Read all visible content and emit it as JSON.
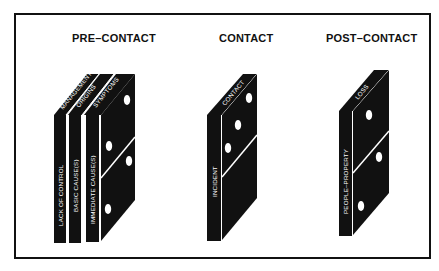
{
  "diagram": {
    "type": "domino-sequence",
    "colors": {
      "domino": "#111111",
      "pip": "#ffffff",
      "frame": "#111111",
      "background": "#ffffff"
    },
    "phases": [
      {
        "title": "PRE–CONTACT",
        "dominoes": [
          {
            "top": "MANAGEMENT",
            "side": "LACK OF CONTROL"
          },
          {
            "top": "ORIGINS",
            "side": "BASIC CAUSE(S)"
          },
          {
            "top": "SYMPTOMS",
            "side": "IMMEDIATE CAUSE(S)"
          }
        ]
      },
      {
        "title": "CONTACT",
        "dominoes": [
          {
            "top": "CONTACT",
            "side": "INCIDENT"
          }
        ]
      },
      {
        "title": "POST–CONTACT",
        "dominoes": [
          {
            "top": "LOSS",
            "side": "PEOPLE–PROPERTY"
          }
        ]
      }
    ]
  }
}
